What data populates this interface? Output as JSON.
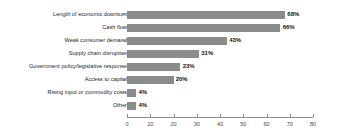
{
  "chart_data": {
    "type": "bar",
    "orientation": "horizontal",
    "title": "",
    "subtitle": "",
    "xlabel": "",
    "ylabel": "",
    "xlim": [
      0,
      80
    ],
    "xticks": [
      0,
      10,
      20,
      30,
      40,
      50,
      60,
      70,
      80
    ],
    "grid": false,
    "legend": null,
    "bar_color": "#8a8c8c",
    "axis_color": "#8d8f8f",
    "value_suffix": "%",
    "categories": [
      "Length of economic downturn",
      "Cash flow",
      "Weak consumer demand",
      "Supply chain disruption",
      "Government policy/legislative response",
      "Access to capital",
      "Rising input or commodity costs",
      "Other"
    ],
    "values": [
      68,
      66,
      43,
      31,
      23,
      20,
      4,
      4
    ],
    "data_labels": [
      "68%",
      "66%",
      "43%",
      "31%",
      "23%",
      "20%",
      "4%",
      "4%"
    ],
    "tick_labels": [
      "0",
      "10",
      "20",
      "30",
      "40",
      "50",
      "60",
      "70",
      "80"
    ]
  }
}
